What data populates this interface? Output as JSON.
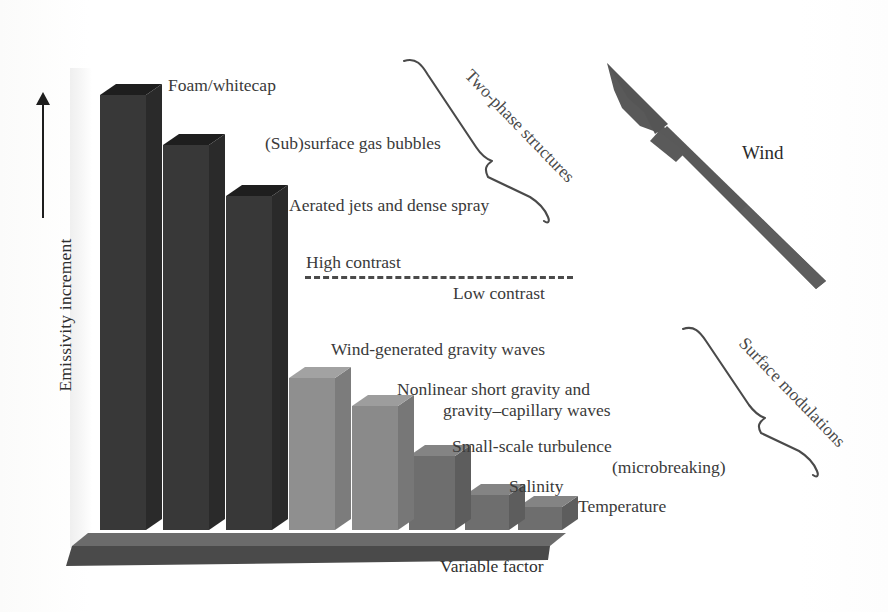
{
  "figure": {
    "axis": {
      "y_label": "Emissivity increment",
      "x_label": "Variable factor",
      "y_arrow_icon": "up-arrow-icon"
    },
    "contrast_divider": {
      "upper_label": "High contrast",
      "lower_label": "Low contrast",
      "style": "dashed"
    },
    "wind": {
      "label": "Wind",
      "arrow_icon": "wind-arrow-icon",
      "direction": "up-left"
    },
    "braces": [
      {
        "label": "Two-phase structures",
        "covers": "bars 1-3",
        "rotation_deg": -45
      },
      {
        "label": "Surface modulations",
        "covers": "bars 4-7",
        "rotation_deg": -45
      }
    ],
    "colors": {
      "bar_dark": "#383838",
      "bar_dark_top": "#1e1e1e",
      "bar_light": "#8a8a8a",
      "bar_light_top": "#9e9e9e",
      "bar_mid": "#6e6e6e",
      "bar_mid_top": "#848484",
      "platform": "#4a4a4a",
      "platform_top": "#6b6b6b",
      "text": "#3a3a3a",
      "dash": "#4a4a4a"
    }
  },
  "chart_data": {
    "type": "bar",
    "title": "",
    "xlabel": "Variable factor",
    "ylabel": "Emissivity increment",
    "grid": false,
    "legend": "none",
    "ylim": [
      0,
      100
    ],
    "note": "Schematic bar chart; heights are relative (no numeric axis ticks shown).",
    "categories": [
      "Foam/whitecap",
      "(Sub)surface gas bubbles",
      "Aerated jets and dense spray",
      "Wind-generated gravity waves",
      "Nonlinear short gravity and gravity–capillary waves",
      "Small-scale turbulence (microbreaking)",
      "Salinity",
      "Temperature"
    ],
    "values": [
      100,
      86,
      73,
      42,
      33,
      21,
      12,
      9
    ],
    "bar_colors": [
      "#383838",
      "#383838",
      "#383838",
      "#8a8a8a",
      "#8a8a8a",
      "#6e6e6e",
      "#6e6e6e",
      "#6e6e6e"
    ],
    "annotations": [
      "High contrast",
      "Low contrast",
      "Two-phase structures",
      "Surface modulations",
      "Wind"
    ]
  },
  "bars": [
    {
      "name": "foam-whitecap",
      "label": "Foam/whitecap",
      "x": 100,
      "w": 46,
      "top": 95,
      "color": "#383838",
      "top_color": "#1e1e1e",
      "side_color": "#2a2a2a"
    },
    {
      "name": "subsurface-bubbles",
      "label": "(Sub)surface gas bubbles",
      "x": 163,
      "w": 46,
      "top": 145,
      "color": "#383838",
      "top_color": "#1e1e1e",
      "side_color": "#2a2a2a"
    },
    {
      "name": "aerated-jets",
      "label": "Aerated jets and dense spray",
      "x": 226,
      "w": 46,
      "top": 196,
      "color": "#383838",
      "top_color": "#1e1e1e",
      "side_color": "#2a2a2a"
    },
    {
      "name": "wind-gravity-waves",
      "label": "Wind-generated gravity waves",
      "x": 289,
      "w": 46,
      "top": 378,
      "color": "#8f8f8f",
      "top_color": "#a2a2a2",
      "side_color": "#7c7c7c"
    },
    {
      "name": "nonlinear-short-waves",
      "label": "Nonlinear short gravity and",
      "x": 352,
      "w": 46,
      "top": 406,
      "color": "#8a8a8a",
      "top_color": "#9d9d9d",
      "side_color": "#777777"
    },
    {
      "name": "small-scale-turbulence",
      "label": "Small-scale turbulence",
      "x": 409,
      "w": 46,
      "top": 456,
      "color": "#6e6e6e",
      "top_color": "#848484",
      "side_color": "#5d5d5d"
    },
    {
      "name": "salinity",
      "label": "Salinity",
      "x": 465,
      "w": 44,
      "top": 495,
      "color": "#6e6e6e",
      "top_color": "#848484",
      "side_color": "#5d5d5d"
    },
    {
      "name": "temperature",
      "label": "Temperature",
      "x": 518,
      "w": 44,
      "top": 507,
      "color": "#6e6e6e",
      "top_color": "#848484",
      "side_color": "#5d5d5d"
    }
  ],
  "callouts": {
    "foam": "Foam/whitecap",
    "bubbles": "(Sub)surface gas bubbles",
    "aerated": "Aerated jets and dense spray",
    "high": "High contrast",
    "low": "Low contrast",
    "windwaves": "Wind-generated gravity waves",
    "nonlinear_1": "Nonlinear short gravity and",
    "nonlinear_2": "gravity–capillary waves",
    "turbulence_1": "Small-scale turbulence",
    "turbulence_2": "(microbreaking)",
    "salinity": "Salinity",
    "temperature": "Temperature",
    "two_phase": "Two-phase structures",
    "surface_mod": "Surface modulations",
    "wind": "Wind"
  }
}
